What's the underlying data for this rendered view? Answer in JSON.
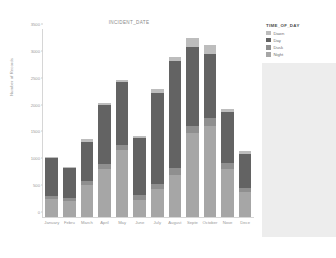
{
  "chart_data": {
    "type": "bar",
    "stacked": true,
    "title": "INCIDENT_DATE",
    "xlabel": "",
    "ylabel": "Number of Records",
    "categories": [
      "January",
      "Febru",
      "March",
      "April",
      "May",
      "June",
      "July",
      "August",
      "Septe",
      "October",
      "Nove",
      "Dece"
    ],
    "yticks": [
      0,
      500,
      1000,
      1500,
      2000,
      2500,
      3000,
      3500
    ],
    "ylim": [
      0,
      3500
    ],
    "grid": false,
    "legend_position": "right",
    "series": [
      {
        "name": "Night",
        "color": "#a6a6a6",
        "values": [
          330,
          300,
          590,
          900,
          1240,
          320,
          520,
          790,
          1560,
          1700,
          900,
          460
        ]
      },
      {
        "name": "Dusk",
        "color": "#8f8f8f",
        "values": [
          70,
          55,
          75,
          90,
          105,
          85,
          95,
          115,
          140,
          140,
          110,
          80
        ]
      },
      {
        "name": "Day",
        "color": "#636363",
        "values": [
          690,
          560,
          740,
          1100,
          1160,
          1070,
          1700,
          2000,
          1460,
          1200,
          940,
          640
        ]
      },
      {
        "name": "Dawn",
        "color": "#bdbdbd",
        "values": [
          30,
          25,
          55,
          30,
          45,
          35,
          60,
          75,
          180,
          160,
          60,
          40
        ]
      }
    ]
  },
  "legend": {
    "title": "TIME_OF_DAY",
    "items": [
      {
        "label": "Dawn",
        "color": "#bdbdbd"
      },
      {
        "label": "Day",
        "color": "#636363"
      },
      {
        "label": "Dusk",
        "color": "#8f8f8f"
      },
      {
        "label": "Night",
        "color": "#a6a6a6"
      }
    ]
  }
}
